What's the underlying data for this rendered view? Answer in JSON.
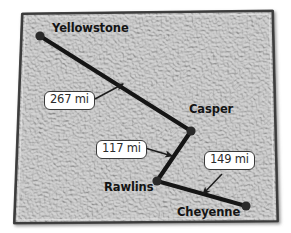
{
  "figure": {
    "name": "wyoming-distance-map",
    "width": 291,
    "height": 233,
    "background_color": "#ffffff"
  },
  "map": {
    "name": "wyoming-state-outline",
    "fill_color": "#cfcfcf",
    "border_color": "#4a4a4a",
    "texture": "mottled-stucco"
  },
  "cities": [
    {
      "id": "yellowstone",
      "label": "Yellowstone",
      "node_x": 40,
      "node_y": 36,
      "label_x": 52,
      "label_y": 28,
      "dot_color": "#2a2a2a"
    },
    {
      "id": "casper",
      "label": "Casper",
      "node_x": 191,
      "node_y": 131,
      "label_x": 189,
      "label_y": 109,
      "dot_color": "#2a2a2a"
    },
    {
      "id": "rawlins",
      "label": "Rawlins",
      "node_x": 157,
      "node_y": 181,
      "label_x": 103,
      "label_y": 186,
      "dot_color": "#2a2a2a"
    },
    {
      "id": "cheyenne",
      "label": "Cheyenne",
      "node_x": 246,
      "node_y": 206,
      "label_x": 176,
      "label_y": 211,
      "dot_color": "#2a2a2a"
    }
  ],
  "routes": [
    {
      "id": "yellowstone-casper",
      "from": "yellowstone",
      "to": "casper",
      "distance_text": "267 mi",
      "distance_value": 267,
      "unit": "mi",
      "line_color": "#151515"
    },
    {
      "id": "casper-rawlins",
      "from": "casper",
      "to": "rawlins",
      "distance_text": "117 mi",
      "distance_value": 117,
      "unit": "mi",
      "line_color": "#151515"
    },
    {
      "id": "rawlins-cheyenne",
      "from": "rawlins",
      "to": "cheyenne",
      "distance_text": "149 mi",
      "distance_value": 149,
      "unit": "mi",
      "line_color": "#151515"
    }
  ],
  "distance_labels": [
    {
      "id": "label-267",
      "text": "267 mi",
      "box_x": 44,
      "box_y": 92,
      "arrow_from_x": 95,
      "arrow_from_y": 98,
      "arrow_to_x": 122,
      "arrow_to_y": 84
    },
    {
      "id": "label-117",
      "text": "117 mi",
      "box_x": 96,
      "box_y": 141,
      "arrow_from_x": 144,
      "arrow_from_y": 148,
      "arrow_to_x": 171,
      "arrow_to_y": 155
    },
    {
      "id": "label-149",
      "text": "149 mi",
      "box_x": 204,
      "box_y": 152,
      "arrow_from_x": 220,
      "arrow_from_y": 175,
      "arrow_to_x": 205,
      "arrow_to_y": 193
    }
  ]
}
